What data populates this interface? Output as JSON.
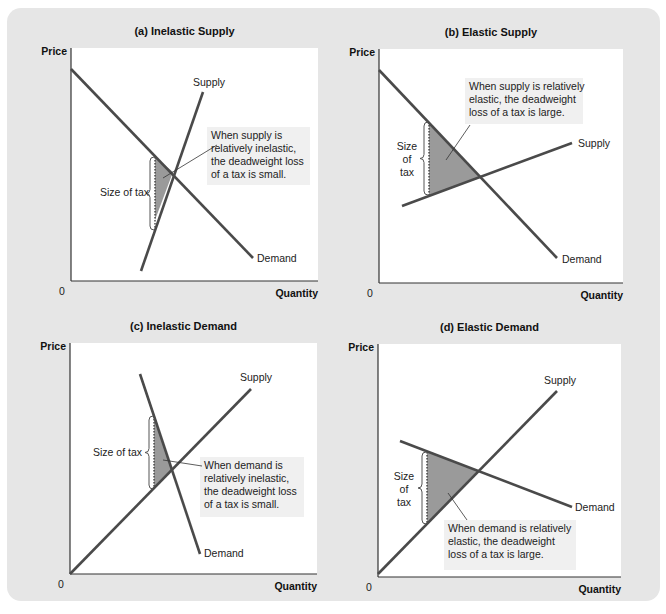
{
  "chart_data": [
    {
      "type": "line",
      "id": "a",
      "title": "(a) Inelastic Supply",
      "xlabel": "Quantity",
      "ylabel": "Price",
      "origin_label": "0",
      "grid": false,
      "plot": {
        "x": 71,
        "y": 48,
        "w": 247,
        "h": 233
      },
      "series": [
        {
          "name": "Demand",
          "points": [
            [
              71,
              69
            ],
            [
              253,
              258
            ]
          ],
          "label": "Demand",
          "label_pos": [
            257,
            262
          ]
        },
        {
          "name": "Supply",
          "points": [
            [
              141,
              271
            ],
            [
              203,
              92
            ]
          ],
          "label": "Supply",
          "label_pos": [
            193,
            86
          ]
        }
      ],
      "deadweight_loss": [
        [
          155,
          157
        ],
        [
          173,
          172
        ],
        [
          155,
          220
        ]
      ],
      "tax_bar": {
        "x": 155,
        "top": 157,
        "bottom": 230
      },
      "brace": {
        "x": 150,
        "top": 157,
        "bottom": 230
      },
      "tax_label": [
        "Size of tax"
      ],
      "tax_label_pos": [
        100,
        196
      ],
      "callout": {
        "lines": [
          "When supply is",
          "relatively inelastic,",
          "the deadweight loss",
          "of a tax is small."
        ],
        "box": [
          207,
          127,
          103,
          58
        ],
        "pointer": [
          [
            217,
            145
          ],
          [
            163,
            178
          ]
        ]
      }
    },
    {
      "type": "line",
      "id": "b",
      "title": "(b) Elastic Supply",
      "xlabel": "Quantity",
      "ylabel": "Price",
      "origin_label": "0",
      "grid": false,
      "plot": {
        "x": 379,
        "y": 49,
        "w": 244,
        "h": 234
      },
      "series": [
        {
          "name": "Demand",
          "points": [
            [
              379,
              70
            ],
            [
              557,
              258
            ]
          ],
          "label": "Demand",
          "label_pos": [
            562,
            263
          ]
        },
        {
          "name": "Supply",
          "points": [
            [
              402,
              206
            ],
            [
              572,
              143
            ]
          ],
          "label": "Supply",
          "label_pos": [
            578,
            147
          ]
        }
      ],
      "deadweight_loss": [
        [
          429,
          122
        ],
        [
          480,
          178
        ],
        [
          429,
          195
        ]
      ],
      "tax_bar": {
        "x": 429,
        "top": 122,
        "bottom": 195
      },
      "brace": {
        "x": 424,
        "top": 122,
        "bottom": 195
      },
      "tax_label": [
        "Size",
        "of",
        "tax"
      ],
      "tax_label_pos": [
        407,
        150
      ],
      "callout": {
        "lines": [
          "When supply is relatively",
          "elastic, the deadweight",
          "loss of a tax is large."
        ],
        "box": [
          465,
          78,
          118,
          46
        ],
        "pointer": [
          [
            470,
            125
          ],
          [
            446,
            160
          ]
        ]
      }
    },
    {
      "type": "line",
      "id": "c",
      "title": "(c) Inelastic Demand",
      "xlabel": "Quantity",
      "ylabel": "Price",
      "origin_label": "0",
      "grid": false,
      "plot": {
        "x": 70,
        "y": 343,
        "w": 247,
        "h": 231
      },
      "series": [
        {
          "name": "Demand",
          "points": [
            [
              140,
              374
            ],
            [
              200,
              554
            ]
          ],
          "label": "Demand",
          "label_pos": [
            204,
            557
          ]
        },
        {
          "name": "Supply",
          "points": [
            [
              70,
              574
            ],
            [
              251,
              389
            ]
          ],
          "label": "Supply",
          "label_pos": [
            240,
            381
          ]
        }
      ],
      "deadweight_loss": [
        [
          154,
          416
        ],
        [
          172,
          469
        ],
        [
          154,
          489
        ]
      ],
      "tax_bar": {
        "x": 154,
        "top": 416,
        "bottom": 489
      },
      "brace": {
        "x": 149,
        "top": 416,
        "bottom": 489
      },
      "tax_label": [
        "Size of tax"
      ],
      "tax_label_pos": [
        93,
        456
      ],
      "callout": {
        "lines": [
          "When demand is",
          "relatively inelastic,",
          "the deadweight loss",
          "of a tax is small."
        ],
        "box": [
          200,
          457,
          104,
          60
        ],
        "pointer": [
          [
            202,
            466
          ],
          [
            163,
            460
          ]
        ]
      }
    },
    {
      "type": "line",
      "id": "d",
      "title": "(d) Elastic Demand",
      "xlabel": "Quantity",
      "ylabel": "Price",
      "origin_label": "0",
      "grid": false,
      "plot": {
        "x": 378,
        "y": 344,
        "w": 243,
        "h": 233
      },
      "series": [
        {
          "name": "Demand",
          "points": [
            [
              400,
              441
            ],
            [
              572,
              507
            ]
          ],
          "label": "Demand",
          "label_pos": [
            575,
            511
          ]
        },
        {
          "name": "Supply",
          "points": [
            [
              378,
              574
            ],
            [
              557,
              391
            ]
          ],
          "label": "Supply",
          "label_pos": [
            544,
            384
          ]
        }
      ],
      "deadweight_loss": [
        [
          427,
          452
        ],
        [
          478,
          471
        ],
        [
          427,
          524
        ]
      ],
      "tax_bar": {
        "x": 427,
        "top": 452,
        "bottom": 524
      },
      "brace": {
        "x": 422,
        "top": 452,
        "bottom": 524
      },
      "tax_label": [
        "Size",
        "of",
        "tax"
      ],
      "tax_label_pos": [
        404,
        480
      ],
      "callout": {
        "lines": [
          "When demand is relatively",
          "elastic, the deadweight",
          "loss of a tax is large."
        ],
        "box": [
          444,
          520,
          132,
          50
        ],
        "pointer": [
          [
            467,
            520
          ],
          [
            448,
            493
          ]
        ]
      }
    }
  ],
  "colors": {
    "frame": "#e6e6e6",
    "plot_bg": "#ffffff",
    "line": "#4a4a4a",
    "axis": "#333333",
    "dwl_fill": "#9a9a9a",
    "callout_bg": "#f0f0f0"
  }
}
